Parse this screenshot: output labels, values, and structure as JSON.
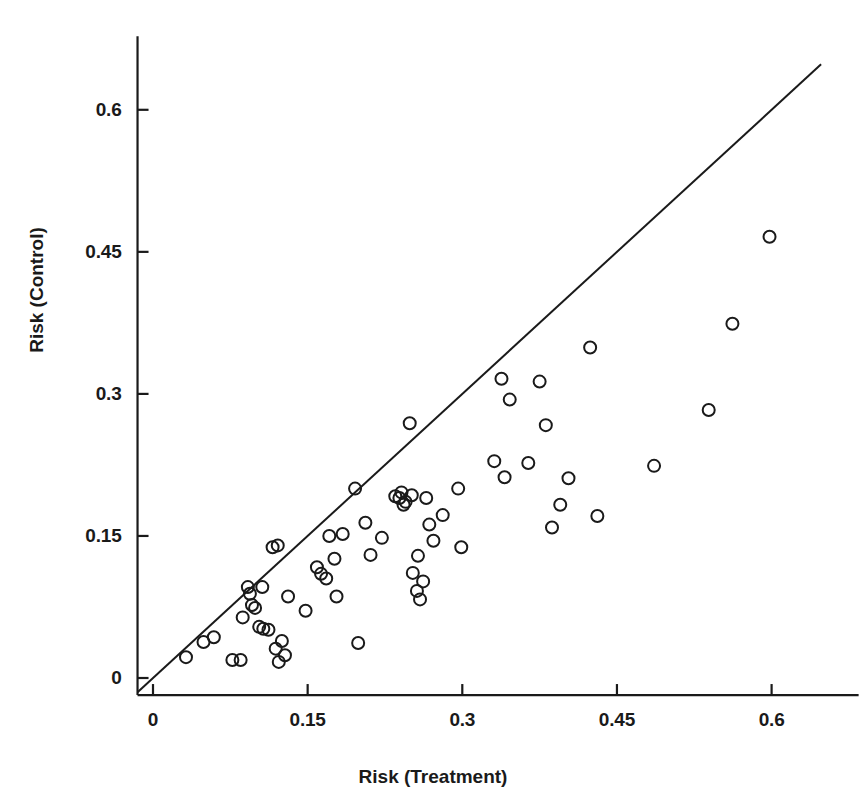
{
  "chart_data": {
    "type": "scatter",
    "title": "",
    "xlabel": "Risk (Treatment)",
    "ylabel": "Risk (Control)",
    "xlim": [
      -0.015,
      0.665
    ],
    "ylim": [
      -0.018,
      0.648
    ],
    "xticks": [
      0,
      0.15,
      0.3,
      0.45,
      0.6
    ],
    "xtick_labels": [
      "0",
      "0.15",
      "0.3",
      "0.45",
      "0.6"
    ],
    "yticks": [
      0,
      0.15,
      0.3,
      0.45,
      0.6
    ],
    "ytick_labels": [
      "0",
      "0.15",
      "0.3",
      "0.45",
      "0.6"
    ],
    "grid": false,
    "legend": null,
    "marker": "open-circle",
    "marker_color": "#1a1a1a",
    "marker_fill": "none",
    "marker_size": 12,
    "reference_line": {
      "name": "identity-line",
      "type": "line",
      "slope": 1,
      "intercept": 0,
      "x_start": -0.015,
      "x_end": 0.648,
      "color": "#1a1a1a",
      "width": 2
    },
    "axis_color": "#1a1a1a",
    "background": "#ffffff",
    "n_points": 68,
    "points": [
      {
        "x": 0.032,
        "y": 0.022
      },
      {
        "x": 0.049,
        "y": 0.038
      },
      {
        "x": 0.059,
        "y": 0.043
      },
      {
        "x": 0.077,
        "y": 0.019
      },
      {
        "x": 0.085,
        "y": 0.019
      },
      {
        "x": 0.087,
        "y": 0.064
      },
      {
        "x": 0.092,
        "y": 0.096
      },
      {
        "x": 0.094,
        "y": 0.089
      },
      {
        "x": 0.096,
        "y": 0.077
      },
      {
        "x": 0.099,
        "y": 0.074
      },
      {
        "x": 0.103,
        "y": 0.054
      },
      {
        "x": 0.107,
        "y": 0.052
      },
      {
        "x": 0.112,
        "y": 0.051
      },
      {
        "x": 0.116,
        "y": 0.138
      },
      {
        "x": 0.121,
        "y": 0.14
      },
      {
        "x": 0.119,
        "y": 0.031
      },
      {
        "x": 0.122,
        "y": 0.017
      },
      {
        "x": 0.125,
        "y": 0.039
      },
      {
        "x": 0.131,
        "y": 0.086
      },
      {
        "x": 0.148,
        "y": 0.071
      },
      {
        "x": 0.159,
        "y": 0.117
      },
      {
        "x": 0.163,
        "y": 0.11
      },
      {
        "x": 0.168,
        "y": 0.105
      },
      {
        "x": 0.171,
        "y": 0.15
      },
      {
        "x": 0.176,
        "y": 0.126
      },
      {
        "x": 0.178,
        "y": 0.086
      },
      {
        "x": 0.196,
        "y": 0.2
      },
      {
        "x": 0.199,
        "y": 0.037
      },
      {
        "x": 0.206,
        "y": 0.164
      },
      {
        "x": 0.211,
        "y": 0.13
      },
      {
        "x": 0.222,
        "y": 0.148
      },
      {
        "x": 0.235,
        "y": 0.192
      },
      {
        "x": 0.239,
        "y": 0.19
      },
      {
        "x": 0.241,
        "y": 0.196
      },
      {
        "x": 0.245,
        "y": 0.186
      },
      {
        "x": 0.249,
        "y": 0.269
      },
      {
        "x": 0.251,
        "y": 0.193
      },
      {
        "x": 0.252,
        "y": 0.111
      },
      {
        "x": 0.256,
        "y": 0.092
      },
      {
        "x": 0.257,
        "y": 0.129
      },
      {
        "x": 0.259,
        "y": 0.083
      },
      {
        "x": 0.262,
        "y": 0.102
      },
      {
        "x": 0.265,
        "y": 0.19
      },
      {
        "x": 0.268,
        "y": 0.162
      },
      {
        "x": 0.272,
        "y": 0.145
      },
      {
        "x": 0.281,
        "y": 0.172
      },
      {
        "x": 0.296,
        "y": 0.2
      },
      {
        "x": 0.299,
        "y": 0.138
      },
      {
        "x": 0.331,
        "y": 0.229
      },
      {
        "x": 0.338,
        "y": 0.316
      },
      {
        "x": 0.341,
        "y": 0.212
      },
      {
        "x": 0.346,
        "y": 0.294
      },
      {
        "x": 0.364,
        "y": 0.227
      },
      {
        "x": 0.375,
        "y": 0.313
      },
      {
        "x": 0.381,
        "y": 0.267
      },
      {
        "x": 0.387,
        "y": 0.159
      },
      {
        "x": 0.395,
        "y": 0.183
      },
      {
        "x": 0.403,
        "y": 0.211
      },
      {
        "x": 0.424,
        "y": 0.349
      },
      {
        "x": 0.431,
        "y": 0.171
      },
      {
        "x": 0.486,
        "y": 0.224
      },
      {
        "x": 0.539,
        "y": 0.283
      },
      {
        "x": 0.562,
        "y": 0.374
      },
      {
        "x": 0.598,
        "y": 0.466
      },
      {
        "x": 0.184,
        "y": 0.152
      },
      {
        "x": 0.106,
        "y": 0.096
      },
      {
        "x": 0.128,
        "y": 0.024
      },
      {
        "x": 0.243,
        "y": 0.183
      }
    ]
  }
}
